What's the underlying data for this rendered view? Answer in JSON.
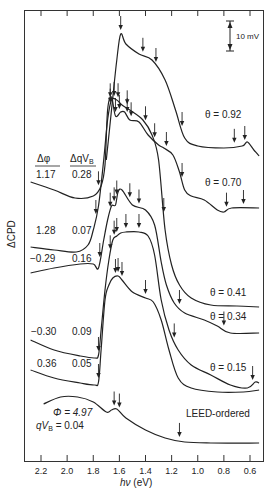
{
  "chart_data": {
    "type": "line",
    "title": "",
    "xlabel": "hν (eV)",
    "ylabel": "ΔCPD",
    "xlim": [
      2.3,
      0.5
    ],
    "x_reversed": true,
    "x_ticks": [
      "2.2",
      "2.0",
      "1.8",
      "1.6",
      "1.4",
      "1.2",
      "1.0",
      "0.8",
      "0.6"
    ],
    "grid": false,
    "scale_bar": {
      "label": "10 mV"
    },
    "table_headers": {
      "dphi": "Δφ",
      "dqvb": "ΔqV_B"
    },
    "series": [
      {
        "name": "θ = 0.92",
        "theta_label": "θ = 0.92",
        "dphi": null,
        "dqvb": null,
        "points": [
          [
            1.7,
            160
          ],
          [
            1.66,
            110
          ],
          [
            1.62,
            60
          ],
          [
            1.59,
            34
          ],
          [
            1.55,
            44
          ],
          [
            1.45,
            54
          ],
          [
            1.35,
            60
          ],
          [
            1.25,
            80
          ],
          [
            1.17,
            110
          ],
          [
            1.1,
            138
          ],
          [
            1.0,
            146
          ],
          [
            0.8,
            148
          ],
          [
            0.66,
            146
          ],
          [
            0.62,
            142
          ],
          [
            0.57,
            150
          ],
          [
            0.53,
            156
          ]
        ],
        "arrows": [
          1.59,
          1.42,
          1.32,
          1.12,
          0.72,
          0.64
        ]
      },
      {
        "name": "θ = 0.70",
        "theta_label": "θ = 0.70",
        "dphi": "1.17",
        "dqvb": "0.28",
        "points": [
          [
            2.28,
            182
          ],
          [
            2.1,
            190
          ],
          [
            1.94,
            198
          ],
          [
            1.8,
            196
          ],
          [
            1.74,
            186
          ],
          [
            1.71,
            165
          ],
          [
            1.69,
            110
          ],
          [
            1.66,
            97
          ],
          [
            1.63,
            116
          ],
          [
            1.59,
            112
          ],
          [
            1.56,
            112
          ],
          [
            1.52,
            120
          ],
          [
            1.45,
            122
          ],
          [
            1.38,
            135
          ],
          [
            1.3,
            145
          ],
          [
            1.26,
            148
          ],
          [
            1.19,
            155
          ],
          [
            1.14,
            172
          ],
          [
            1.1,
            190
          ],
          [
            1.05,
            196
          ],
          [
            0.95,
            200
          ],
          [
            0.85,
            210
          ],
          [
            0.8,
            212
          ],
          [
            0.74,
            208
          ],
          [
            0.53,
            208
          ]
        ],
        "arrows": [
          1.76,
          1.67,
          1.63,
          1.6,
          1.54,
          1.51,
          1.33,
          1.24,
          1.12,
          0.78,
          0.65
        ]
      },
      {
        "name": "θ = 0.41",
        "theta_label": "θ = 0.41",
        "dphi": "1.28",
        "dqvb": "0.07",
        "points": [
          [
            2.28,
            247
          ],
          [
            2.1,
            250
          ],
          [
            1.93,
            252
          ],
          [
            1.84,
            245
          ],
          [
            1.8,
            230
          ],
          [
            1.76,
            206
          ],
          [
            1.72,
            160
          ],
          [
            1.69,
            120
          ],
          [
            1.66,
            100
          ],
          [
            1.62,
            100
          ],
          [
            1.58,
            105
          ],
          [
            1.52,
            110
          ],
          [
            1.42,
            120
          ],
          [
            1.35,
            135
          ],
          [
            1.3,
            160
          ],
          [
            1.25,
            230
          ],
          [
            1.2,
            265
          ],
          [
            1.14,
            285
          ],
          [
            1.05,
            298
          ],
          [
            0.9,
            305
          ],
          [
            0.7,
            306
          ],
          [
            0.53,
            307
          ]
        ],
        "arrows": [
          1.78,
          1.67,
          1.64,
          1.61,
          1.54,
          1.4,
          1.26
        ]
      },
      {
        "name": "θ = 0.34",
        "theta_label": "θ = 0.34",
        "dphi": "-0.29",
        "dqvb": "0.16",
        "points": [
          [
            2.28,
            273
          ],
          [
            2.1,
            268
          ],
          [
            1.9,
            264
          ],
          [
            1.8,
            264
          ],
          [
            1.76,
            268
          ],
          [
            1.72,
            240
          ],
          [
            1.69,
            220
          ],
          [
            1.66,
            206
          ],
          [
            1.63,
            205
          ],
          [
            1.61,
            192
          ],
          [
            1.58,
            190
          ],
          [
            1.5,
            205
          ],
          [
            1.4,
            210
          ],
          [
            1.33,
            225
          ],
          [
            1.28,
            262
          ],
          [
            1.24,
            285
          ],
          [
            1.18,
            303
          ],
          [
            1.1,
            313
          ],
          [
            0.95,
            320
          ],
          [
            0.85,
            326
          ],
          [
            0.75,
            333
          ],
          [
            0.53,
            333
          ]
        ],
        "arrows": [
          1.75,
          1.67,
          1.64,
          1.62,
          1.52,
          1.45,
          1.14,
          0.8
        ]
      },
      {
        "name": "θ = 0.15",
        "theta_label": "θ = 0.15",
        "dphi": "-0.30",
        "dqvb": "0.09",
        "points": [
          [
            2.28,
            340
          ],
          [
            2.1,
            350
          ],
          [
            1.9,
            356
          ],
          [
            1.79,
            358
          ],
          [
            1.76,
            355
          ],
          [
            1.74,
            330
          ],
          [
            1.71,
            290
          ],
          [
            1.68,
            260
          ],
          [
            1.65,
            240
          ],
          [
            1.62,
            236
          ],
          [
            1.59,
            233
          ],
          [
            1.55,
            232
          ],
          [
            1.45,
            232
          ],
          [
            1.38,
            236
          ],
          [
            1.33,
            255
          ],
          [
            1.28,
            300
          ],
          [
            1.22,
            330
          ],
          [
            1.15,
            350
          ],
          [
            1.05,
            365
          ],
          [
            0.9,
            375
          ],
          [
            0.75,
            385
          ],
          [
            0.62,
            388
          ],
          [
            0.56,
            382
          ],
          [
            0.53,
            383
          ]
        ],
        "arrows": [
          1.76,
          1.67,
          1.64,
          1.62,
          1.55,
          1.45,
          1.18,
          0.58
        ]
      },
      {
        "name": "LEED-ordered-lower",
        "theta_label": "",
        "dphi": "0.36",
        "dqvb": "0.05",
        "points": [
          [
            2.28,
            370
          ],
          [
            2.1,
            378
          ],
          [
            1.9,
            383
          ],
          [
            1.79,
            385
          ],
          [
            1.76,
            382
          ],
          [
            1.74,
            350
          ],
          [
            1.71,
            300
          ],
          [
            1.68,
            285
          ],
          [
            1.65,
            278
          ],
          [
            1.61,
            276
          ],
          [
            1.58,
            280
          ],
          [
            1.5,
            292
          ],
          [
            1.4,
            298
          ],
          [
            1.34,
            302
          ],
          [
            1.28,
            320
          ],
          [
            1.22,
            350
          ],
          [
            1.15,
            378
          ],
          [
            1.05,
            388
          ],
          [
            0.85,
            392
          ],
          [
            0.65,
            392
          ],
          [
            0.53,
            390
          ]
        ],
        "arrows": [
          1.76,
          1.63,
          1.61,
          1.58,
          1.4
        ]
      },
      {
        "name": "LEED-ordered",
        "theta_label": "LEED-ordered",
        "phi_label": "Φ = 4.97",
        "qvb_label": "qV_B = 0.04",
        "points": [
          [
            2.18,
            404
          ],
          [
            2.05,
            397
          ],
          [
            1.92,
            397
          ],
          [
            1.8,
            402
          ],
          [
            1.7,
            412
          ],
          [
            1.66,
            410
          ],
          [
            1.62,
            409
          ],
          [
            1.55,
            418
          ],
          [
            1.4,
            430
          ],
          [
            1.25,
            438
          ],
          [
            1.1,
            442
          ],
          [
            0.9,
            443
          ],
          [
            0.53,
            443
          ]
        ],
        "arrows": [
          1.64,
          1.6,
          1.14
        ]
      }
    ]
  },
  "labels": {
    "dphi_header": "Δφ",
    "dqvb_header": "ΔqV",
    "dqvb_sub": "B",
    "row1_dphi": "1.17",
    "row1_dqvb": "0.28",
    "row2_dphi": "1.28",
    "row2_dqvb": "0.07",
    "row3_dphi": "−0.29",
    "row3_dqvb": "0.16",
    "row4_dphi": "−0.30",
    "row4_dqvb": "0.09",
    "row5_dphi": "0.36",
    "row5_dqvb": "0.05",
    "theta_092": "θ = 0.92",
    "theta_070": "θ = 0.70",
    "theta_041": "θ = 0.41",
    "theta_034": "θ = 0.34",
    "theta_015": "θ = 0.15",
    "leed": "LEED-ordered",
    "phi": "Φ = 4.97",
    "qvb_q": "qV",
    "qvb_sub": "B",
    "qvb_val": " = 0.04",
    "scale": "10 mV",
    "ylabel": "ΔCPD",
    "xlabel_h": "hν",
    "xlabel_unit": " (eV)"
  }
}
